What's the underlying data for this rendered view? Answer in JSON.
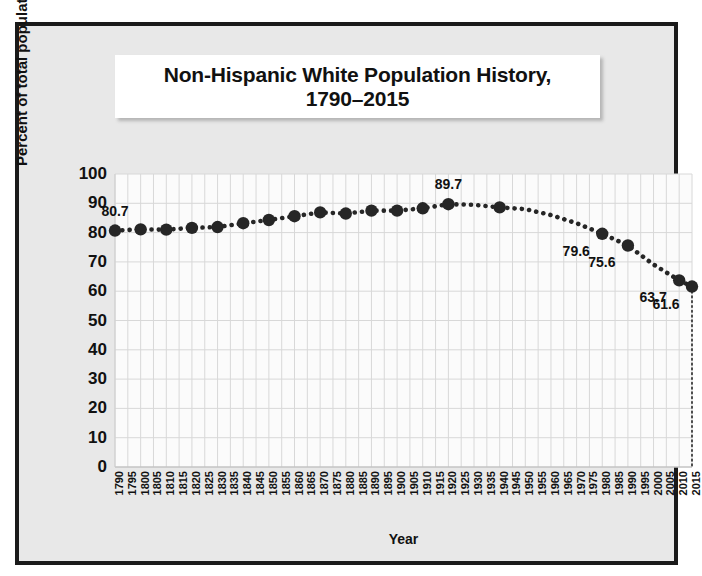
{
  "figure": {
    "title_line1": "Non-Hispanic White Population History,",
    "title_line2": "1790–2015",
    "frame_color": "#1a1a1a",
    "panel_color": "#e8e8e8",
    "marker_color": "#262626"
  },
  "chart_data": {
    "type": "line",
    "title": "Non-Hispanic White Population History, 1790–2015",
    "xlabel": "Year",
    "ylabel": "Percent of total population",
    "ylim": [
      0,
      100
    ],
    "ytick_step": 10,
    "yticks": [
      0,
      10,
      20,
      30,
      40,
      50,
      60,
      70,
      80,
      90,
      100
    ],
    "xlim": [
      1790,
      2015
    ],
    "xtick_step": 5,
    "grid": true,
    "legend": "none",
    "categories": [
      "1790",
      "1795",
      "1800",
      "1805",
      "1810",
      "1815",
      "1820",
      "1825",
      "1830",
      "1835",
      "1840",
      "1845",
      "1850",
      "1855",
      "1860",
      "1865",
      "1870",
      "1875",
      "1880",
      "1885",
      "1890",
      "1895",
      "1900",
      "1905",
      "1910",
      "1915",
      "1920",
      "1925",
      "1930",
      "1935",
      "1940",
      "1945",
      "1950",
      "1955",
      "1960",
      "1965",
      "1970",
      "1975",
      "1980",
      "1985",
      "1990",
      "1995",
      "2000",
      "2005",
      "2010",
      "2015"
    ],
    "marker_points": [
      {
        "x": 1790,
        "y": 80.7,
        "label": "80.7"
      },
      {
        "x": 1800,
        "y": 81.1,
        "label": null
      },
      {
        "x": 1810,
        "y": 81.0,
        "label": null
      },
      {
        "x": 1820,
        "y": 81.6,
        "label": null
      },
      {
        "x": 1830,
        "y": 81.9,
        "label": null
      },
      {
        "x": 1840,
        "y": 83.2,
        "label": null
      },
      {
        "x": 1850,
        "y": 84.3,
        "label": null
      },
      {
        "x": 1860,
        "y": 85.6,
        "label": null
      },
      {
        "x": 1870,
        "y": 86.9,
        "label": null
      },
      {
        "x": 1880,
        "y": 86.5,
        "label": null
      },
      {
        "x": 1890,
        "y": 87.5,
        "label": null
      },
      {
        "x": 1900,
        "y": 87.5,
        "label": null
      },
      {
        "x": 1910,
        "y": 88.3,
        "label": null
      },
      {
        "x": 1920,
        "y": 89.7,
        "label": "89.7"
      },
      {
        "x": 1940,
        "y": 88.6,
        "label": null
      },
      {
        "x": 1980,
        "y": 79.6,
        "label": "79.6"
      },
      {
        "x": 1990,
        "y": 75.6,
        "label": "75.6"
      },
      {
        "x": 2010,
        "y": 63.7,
        "label": "63.7"
      },
      {
        "x": 2015,
        "y": 61.6,
        "label": "61.6"
      }
    ],
    "series": [
      {
        "name": "Non-Hispanic White share of U.S. population",
        "style": "dotted",
        "x": [
          1790,
          1800,
          1810,
          1820,
          1830,
          1840,
          1850,
          1860,
          1870,
          1880,
          1890,
          1900,
          1910,
          1920,
          1930,
          1940,
          1950,
          1960,
          1970,
          1980,
          1990,
          2000,
          2010,
          2015
        ],
        "values": [
          80.7,
          81.1,
          81.0,
          81.6,
          81.9,
          83.2,
          84.3,
          85.6,
          86.9,
          86.5,
          87.5,
          87.5,
          88.3,
          89.7,
          89.5,
          88.6,
          88.0,
          86.0,
          83.2,
          79.6,
          75.6,
          69.1,
          63.7,
          61.6
        ]
      }
    ],
    "annotations": [
      {
        "text": "80.7",
        "at_x": 1790,
        "at_y": 80.7,
        "position": "above"
      },
      {
        "text": "89.7",
        "at_x": 1920,
        "at_y": 89.7,
        "position": "above"
      },
      {
        "text": "79.6",
        "at_x": 1980,
        "at_y": 79.6,
        "position": "below-left"
      },
      {
        "text": "75.6",
        "at_x": 1990,
        "at_y": 75.6,
        "position": "below-left"
      },
      {
        "text": "63.7",
        "at_x": 2010,
        "at_y": 63.7,
        "position": "below-left"
      },
      {
        "text": "61.6",
        "at_x": 2015,
        "at_y": 61.6,
        "position": "below-left"
      }
    ],
    "drop_line": {
      "at_x": 2015,
      "from_y": 61.6,
      "to_y": 0,
      "style": "dotted"
    }
  }
}
